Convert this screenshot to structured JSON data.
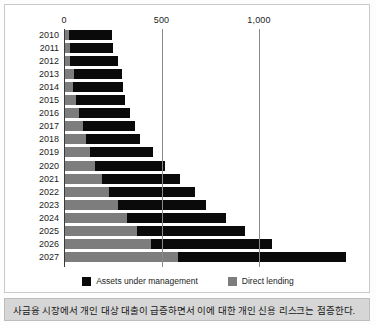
{
  "figure": {
    "caption": "사금융 시장에서 개인 대상 대출이 급증하면서 이에 대한 개인 신용 리스크는 점증한다."
  },
  "legend": {
    "items": [
      {
        "label": "Assets under management",
        "color": "#0a0a0a",
        "swatch": "black-square-icon"
      },
      {
        "label": "Direct lending",
        "color": "#7d7d7d",
        "swatch": "gray-square-icon"
      }
    ]
  },
  "axis": {
    "ticks": [
      "0",
      "500",
      "1,000"
    ],
    "tick_values": [
      0,
      500,
      1000
    ]
  },
  "chart_data": {
    "type": "bar",
    "orientation": "horizontal",
    "stacked": true,
    "title": "",
    "xlabel": "",
    "ylabel": "",
    "xlim": [
      0,
      1500
    ],
    "grid": true,
    "legend_position": "bottom",
    "categories": [
      "2010",
      "2011",
      "2012",
      "2013",
      "2014",
      "2015",
      "2016",
      "2017",
      "2018",
      "2019",
      "2020",
      "2021",
      "2022",
      "2023",
      "2024",
      "2025",
      "2026",
      "2027"
    ],
    "series": [
      {
        "name": "Direct lending",
        "color": "#7d7d7d",
        "values": [
          20,
          25,
          25,
          45,
          40,
          55,
          70,
          90,
          110,
          130,
          155,
          190,
          225,
          270,
          320,
          370,
          440,
          580
        ]
      },
      {
        "name": "Assets under management",
        "color": "#0a0a0a",
        "values": [
          220,
          220,
          245,
          245,
          255,
          255,
          265,
          270,
          275,
          320,
          360,
          400,
          440,
          455,
          505,
          555,
          620,
          860
        ]
      }
    ],
    "totals": [
      240,
      245,
      270,
      290,
      295,
      310,
      335,
      360,
      385,
      450,
      515,
      590,
      665,
      725,
      825,
      925,
      1060,
      1440
    ]
  }
}
